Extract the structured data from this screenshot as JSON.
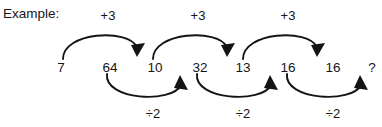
{
  "diagram": {
    "title": "Example:",
    "type": "number-sequence-operation-chain",
    "background_color": "#ffffff",
    "ink_color": "#141414",
    "sequence": [
      {
        "value": "7",
        "x": 61
      },
      {
        "value": "64",
        "x": 110
      },
      {
        "value": "10",
        "x": 155
      },
      {
        "value": "32",
        "x": 200
      },
      {
        "value": "13",
        "x": 243
      },
      {
        "value": "16",
        "x": 288
      },
      {
        "value": "16",
        "x": 333
      },
      {
        "value": "?",
        "x": 372
      }
    ],
    "top_operations": [
      {
        "label": "+3",
        "from": "7",
        "to": "10",
        "center_x": 108
      },
      {
        "label": "+3",
        "from": "32",
        "to": "13",
        "center_x": 198
      },
      {
        "label": "+3",
        "from": "16",
        "to": "16",
        "center_x": 288
      }
    ],
    "bottom_operations": [
      {
        "label": "÷2",
        "from": "64",
        "to": "32",
        "center_x": 153
      },
      {
        "label": "÷2",
        "from": "13",
        "to": "16",
        "center_x": 243
      },
      {
        "label": "÷2",
        "from": "16",
        "to": "?",
        "center_x": 333
      }
    ]
  }
}
